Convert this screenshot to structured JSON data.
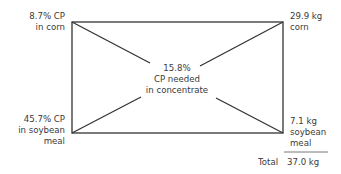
{
  "diagram": {
    "type": "pearson-square",
    "top_left": {
      "line1": "8.7% CP",
      "line2": "in corn"
    },
    "bottom_left": {
      "line1": "45.7% CP",
      "line2": "in soybean",
      "line3": "meal"
    },
    "center": {
      "line1": "15.8%",
      "line2": "CP needed",
      "line3": "in concentrate"
    },
    "top_right": {
      "line1": "29.9 kg",
      "line2": "corn"
    },
    "bottom_right": {
      "line1": "7.1 kg",
      "line2": "soybean",
      "line3": "meal"
    },
    "total": {
      "label": "Total",
      "value": "37.0 kg"
    },
    "colors": {
      "line": "#333333",
      "text": "#3a3a3a"
    }
  }
}
